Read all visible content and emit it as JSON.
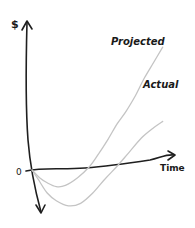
{
  "chart_data": {
    "type": "line",
    "title": "",
    "xlabel": "Time",
    "ylabel": "$",
    "origin_label": "0",
    "xlim": [
      0,
      10
    ],
    "ylim": [
      -3,
      10
    ],
    "grid": false,
    "legend": "inline-labels",
    "series": [
      {
        "name": "Projected",
        "color": "#c4c4c4",
        "x": [
          0,
          0.5,
          1,
          1.6,
          2.2,
          3,
          3.8,
          4.4,
          5,
          5.6,
          6.2,
          6.8,
          7.4,
          8,
          8.6
        ],
        "y": [
          0,
          -0.6,
          -1.0,
          -1.3,
          -1.2,
          -0.6,
          0.3,
          1.3,
          2.4,
          3.6,
          4.6,
          5.8,
          7.2,
          8.4,
          9.6
        ]
      },
      {
        "name": "Actual",
        "color": "#c4c4c4",
        "x": [
          0,
          0.5,
          1,
          1.6,
          2.4,
          3.2,
          4,
          4.8,
          5.6,
          6.4,
          7.2,
          8,
          8.6
        ],
        "y": [
          0,
          -0.9,
          -1.8,
          -2.4,
          -2.8,
          -2.6,
          -1.8,
          -0.7,
          0.3,
          1.4,
          2.5,
          3.3,
          3.8
        ]
      }
    ]
  }
}
